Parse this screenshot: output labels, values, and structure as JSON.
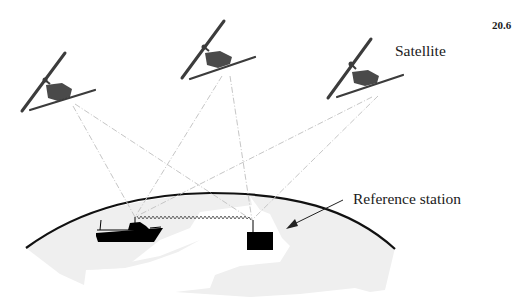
{
  "figure": {
    "number": "20.6",
    "labels": {
      "satellite": "Satellite",
      "reference_station": "Reference station"
    },
    "colors": {
      "satellite_body": "#4a4a4a",
      "panel": "#3c3c3c",
      "signal_lines": "#c8c8c8",
      "earth_outline": "#111111",
      "land": "#efefef",
      "boat": "#000000",
      "station": "#000000",
      "radio_link": "#555555"
    },
    "elements": {
      "satellites": [
        {
          "id": "satellite-1"
        },
        {
          "id": "satellite-2"
        },
        {
          "id": "satellite-3"
        }
      ],
      "receivers": [
        "boat",
        "reference-station"
      ]
    }
  }
}
